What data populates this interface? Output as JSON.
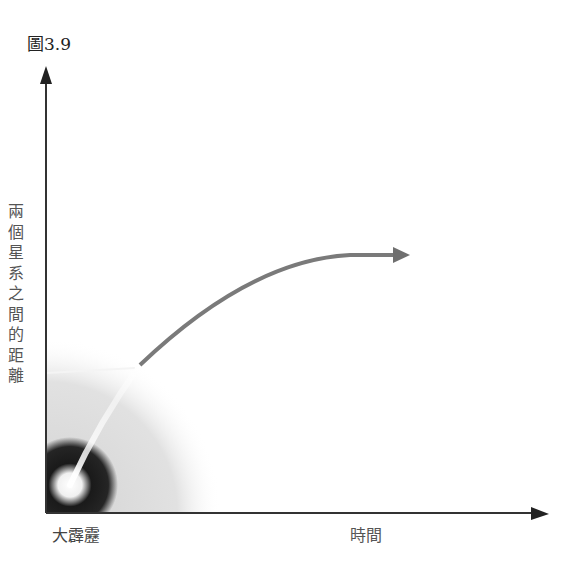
{
  "figure": {
    "label": "圖3.9"
  },
  "axes": {
    "y_label": "兩個星系之間的距離",
    "y_label_chars": [
      "兩",
      "個",
      "星",
      "系",
      "之",
      "間",
      "的",
      "距",
      "離"
    ],
    "x_origin_label": "大霹靂",
    "x_label": "時間"
  },
  "colors": {
    "axis": "#333333",
    "curve": "#7a7a7a",
    "glow_core": "#ffffff",
    "dark_halo": "#111111",
    "haze": "#d8d8d8"
  }
}
